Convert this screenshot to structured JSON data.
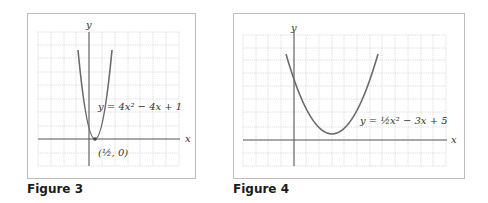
{
  "figures": [
    {
      "caption": "Figure 3",
      "equation_label": "y = 4x² − 4x + 1",
      "point_label": "(½, 0)",
      "x_axis_label": "x",
      "y_axis_label": "y",
      "equation": {
        "a": 4,
        "b": -4,
        "c": 1
      },
      "vertex": [
        0.5,
        0
      ]
    },
    {
      "caption": "Figure 4",
      "equation_label": "y = ½x² − 3x + 5",
      "x_axis_label": "x",
      "y_axis_label": "y",
      "equation": {
        "a": 0.5,
        "b": -3,
        "c": 5
      },
      "vertex": [
        3,
        0.5
      ]
    }
  ],
  "colors": {
    "curve": "#6b6b6b",
    "axis": "#555555",
    "grid": "#c8c8c8",
    "frame": "#bdbdbd"
  }
}
